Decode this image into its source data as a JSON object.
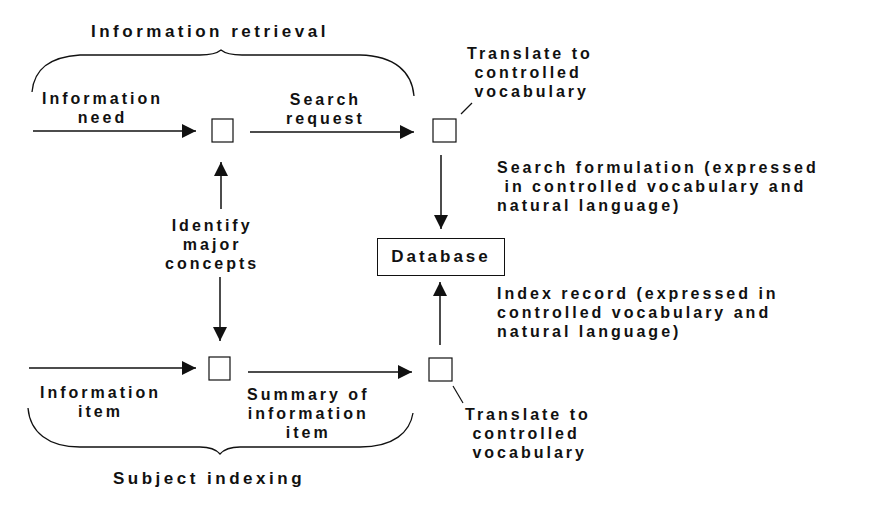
{
  "title_top": "Information retrieval",
  "title_bottom": "Subject indexing",
  "nodes": {
    "database": "Database"
  },
  "labels": {
    "information_need": "Information\nneed",
    "search_request": "Search\nrequest",
    "translate_top": "Translate to\n controlled\n vocabulary",
    "search_formulation": "Search formulation (expressed\n in controlled vocabulary and\nnatural language)",
    "identify_concepts": "Identify\nmajor\nconcepts",
    "index_record": "Index record (expressed in\ncontrolled vocabulary and\nnatural language)",
    "information_item": "Information\nitem",
    "summary": "Summary of\ninformation\nitem",
    "translate_bottom": "Translate to\n controlled\n vocabulary"
  }
}
